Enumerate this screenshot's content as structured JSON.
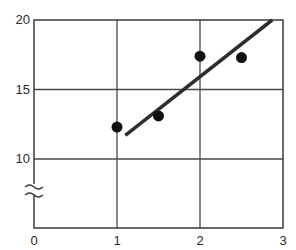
{
  "chart_data": {
    "type": "scatter",
    "title": "",
    "xlabel": "",
    "ylabel": "",
    "xlim": [
      0,
      3
    ],
    "ylim": [
      10,
      20
    ],
    "y_axis_break": true,
    "y_axis_break_note": "axis broken between 0 and 10",
    "grid": true,
    "x_ticks": [
      0,
      1,
      2,
      3
    ],
    "x_tick_labels": [
      "0",
      "1",
      "2",
      "3"
    ],
    "y_ticks": [
      10,
      15,
      20
    ],
    "y_tick_labels": [
      "10",
      "15",
      "20"
    ],
    "series": [
      {
        "name": "data points",
        "type": "scatter",
        "points": [
          {
            "x": 1.0,
            "y": 12.3
          },
          {
            "x": 1.5,
            "y": 13.1
          },
          {
            "x": 2.0,
            "y": 17.4
          },
          {
            "x": 2.5,
            "y": 17.3
          }
        ]
      },
      {
        "name": "fit line",
        "type": "line",
        "points": [
          {
            "x": 1.1,
            "y": 11.7
          },
          {
            "x": 2.87,
            "y": 20.0
          }
        ]
      }
    ],
    "legend": null
  },
  "colors": {
    "axis": "#3a3a3a",
    "grid": "#4a4a4a",
    "marker": "#111111",
    "line": "#2e2e2e"
  }
}
